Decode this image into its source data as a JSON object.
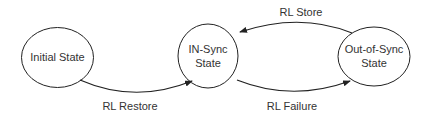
{
  "diagram": {
    "type": "state-transition",
    "colors": {
      "background": "#ffffff",
      "stroke": "#222222",
      "text": "#333333"
    },
    "states": [
      {
        "id": "initial",
        "lines": [
          "Initial State"
        ]
      },
      {
        "id": "in_sync",
        "lines": [
          "IN-Sync",
          "State"
        ]
      },
      {
        "id": "out_of_sync",
        "lines": [
          "Out-of-Sync",
          "State"
        ]
      }
    ],
    "transitions": [
      {
        "from": "initial",
        "to": "in_sync",
        "label": "RL Restore"
      },
      {
        "from": "in_sync",
        "to": "out_of_sync",
        "label": "RL Failure"
      },
      {
        "from": "out_of_sync",
        "to": "in_sync",
        "label": "RL Store"
      }
    ]
  }
}
